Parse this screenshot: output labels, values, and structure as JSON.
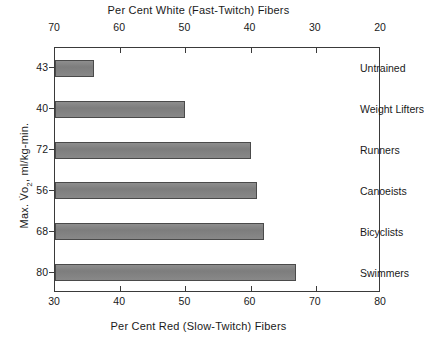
{
  "chart_data": {
    "type": "bar",
    "orientation": "horizontal",
    "title": "",
    "top_axis_label": "Per Cent White (Fast-Twitch) Fibers",
    "bottom_axis_label": "Per Cent Red (Slow-Twitch) Fibers",
    "y_axis_label": "Max. Vo2, ml/kg-min.",
    "categories": [
      "Untrained",
      "Weight Lifters",
      "Runners",
      "Canoeists",
      "Bicyclists",
      "Swimmers"
    ],
    "values": [
      36,
      50,
      60,
      61,
      62,
      67
    ],
    "y_values": [
      43,
      40,
      72,
      56,
      68,
      80
    ],
    "xlabel": "Per Cent Red (Slow-Twitch) Fibers",
    "ylabel": "Max. Vo2, ml/kg-min.",
    "xlim": [
      30,
      80
    ],
    "xlim_top": [
      70,
      20
    ],
    "bottom_ticks": [
      30,
      40,
      50,
      60,
      70,
      80
    ],
    "top_ticks": [
      70,
      60,
      50,
      40,
      30,
      20
    ],
    "grid": false,
    "legend": false,
    "bar_color": "#828282",
    "bar_edge_color": "#4a4a4a",
    "axis_color": "#3a3a3a",
    "series": [
      {
        "name": "Per Cent Red (Slow-Twitch) Fibers",
        "values": [
          36,
          50,
          60,
          61,
          62,
          67
        ]
      }
    ]
  },
  "top_axis": {
    "title": "Per Cent White (Fast-Twitch) Fibers",
    "ticks": [
      {
        "label": "70"
      },
      {
        "label": "60"
      },
      {
        "label": "50"
      },
      {
        "label": "40"
      },
      {
        "label": "30"
      },
      {
        "label": "20"
      }
    ]
  },
  "bottom_axis": {
    "title": "Per Cent Red (Slow-Twitch) Fibers",
    "ticks": [
      {
        "label": "30"
      },
      {
        "label": "40"
      },
      {
        "label": "50"
      },
      {
        "label": "60"
      },
      {
        "label": "70"
      },
      {
        "label": "80"
      }
    ]
  },
  "y_axis": {
    "title": "Max. Vo2, ml/kg-min.",
    "values": [
      "43",
      "40",
      "72",
      "56",
      "68",
      "80"
    ]
  },
  "bars": [
    {
      "label": "Untrained",
      "y_value": "43",
      "red_percent": 36
    },
    {
      "label": "Weight Lifters",
      "y_value": "40",
      "red_percent": 50
    },
    {
      "label": "Runners",
      "y_value": "72",
      "red_percent": 60
    },
    {
      "label": "Canoeists",
      "y_value": "56",
      "red_percent": 61
    },
    {
      "label": "Bicyclists",
      "y_value": "68",
      "red_percent": 62
    },
    {
      "label": "Swimmers",
      "y_value": "80",
      "red_percent": 67
    }
  ]
}
